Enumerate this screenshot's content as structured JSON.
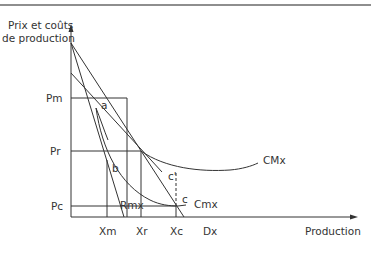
{
  "figure": {
    "y_axis_label_line1": "Prix et coûts",
    "y_axis_label_line2": "de production",
    "x_axis_label": "Production",
    "price_levels": {
      "pm": "Pm",
      "pr": "Pr",
      "pc": "Pc"
    },
    "quantity_levels": {
      "xm": "Xm",
      "xr": "Xr",
      "xc": "Xc",
      "dx": "Dx"
    },
    "points": {
      "a": "a",
      "b": "b",
      "c": "c",
      "c_prime": "c'"
    },
    "curves": {
      "cmx_avg": "CMx",
      "cmx_marginal": "Cmx",
      "rmx": "Rmx"
    },
    "colors": {
      "line": "#333333",
      "rule": "#8e8e8e"
    }
  }
}
